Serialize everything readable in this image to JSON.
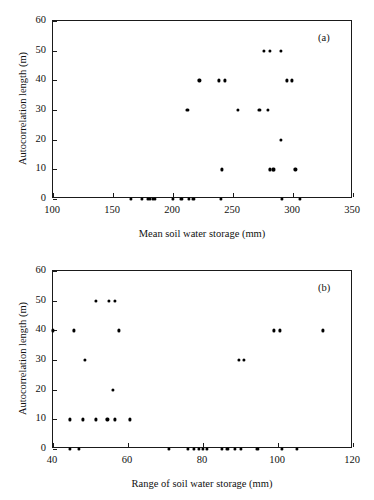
{
  "figure": {
    "background": "#ffffff",
    "marker_color": "#000000",
    "axis_color": "#1a1a1a"
  },
  "panels": [
    {
      "key": "a",
      "letter": "(a)",
      "xlabel": "Mean soil water storage (mm)",
      "ylabel": "Autocorrelation length (m)",
      "xticks": [
        "100",
        "150",
        "200",
        "250",
        "300",
        "350"
      ],
      "yticks": [
        "0",
        "10",
        "20",
        "30",
        "40",
        "50",
        "60"
      ]
    },
    {
      "key": "b",
      "letter": "(b)",
      "xlabel": "Range of soil water storage (mm)",
      "ylabel": "Autocorrelation length (m)",
      "xticks": [
        "40",
        "60",
        "80",
        "100",
        "120"
      ],
      "yticks": [
        "0",
        "10",
        "20",
        "30",
        "40",
        "50",
        "60"
      ]
    }
  ],
  "chart_data": [
    {
      "type": "scatter",
      "panel": "(a)",
      "title": "",
      "xlabel": "Mean soil water storage (mm)",
      "ylabel": "Autocorrelation length (m)",
      "xlim": [
        100,
        350
      ],
      "ylim": [
        0,
        60
      ],
      "xticks": [
        100,
        150,
        200,
        250,
        300,
        350
      ],
      "yticks": [
        0,
        10,
        20,
        30,
        40,
        50,
        60
      ],
      "grid": false,
      "legend": null,
      "marker": "filled-circle",
      "series": [
        {
          "name": "Autocorrelation length vs mean soil water storage",
          "points": [
            [
              165,
              0
            ],
            [
              174,
              0
            ],
            [
              179,
              0
            ],
            [
              181,
              0
            ],
            [
              183,
              0
            ],
            [
              185,
              0
            ],
            [
              200,
              0
            ],
            [
              207,
              0
            ],
            [
              213,
              0
            ],
            [
              217,
              0
            ],
            [
              240,
              0
            ],
            [
              291,
              0
            ],
            [
              306,
              0
            ],
            [
              241,
              10
            ],
            [
              281,
              10
            ],
            [
              283,
              10
            ],
            [
              284,
              10
            ],
            [
              302,
              10
            ],
            [
              290,
              20
            ],
            [
              212,
              30
            ],
            [
              254,
              30
            ],
            [
              272,
              30
            ],
            [
              279,
              30
            ],
            [
              222,
              40
            ],
            [
              238,
              40
            ],
            [
              243,
              40
            ],
            [
              295,
              40
            ],
            [
              299,
              40
            ],
            [
              276,
              50
            ],
            [
              281,
              50
            ],
            [
              290,
              50
            ]
          ]
        }
      ]
    },
    {
      "type": "scatter",
      "panel": "(b)",
      "title": "",
      "xlabel": "Range of soil water storage (mm)",
      "ylabel": "Autocorrelation length (m)",
      "xlim": [
        40,
        120
      ],
      "ylim": [
        0,
        60
      ],
      "xticks": [
        40,
        60,
        80,
        100,
        120
      ],
      "yticks": [
        0,
        10,
        20,
        30,
        40,
        50,
        60
      ],
      "grid": false,
      "legend": null,
      "marker": "filled-circle",
      "series": [
        {
          "name": "Autocorrelation length vs range of soil water storage",
          "points": [
            [
              44.5,
              0
            ],
            [
              47,
              0
            ],
            [
              71,
              0
            ],
            [
              76,
              0
            ],
            [
              77.5,
              0
            ],
            [
              79,
              0
            ],
            [
              80,
              0
            ],
            [
              81,
              0
            ],
            [
              85,
              0
            ],
            [
              86.5,
              0
            ],
            [
              88.5,
              0
            ],
            [
              90,
              0
            ],
            [
              94.5,
              0
            ],
            [
              101,
              0
            ],
            [
              105,
              0
            ],
            [
              44.5,
              10
            ],
            [
              48,
              10
            ],
            [
              51.5,
              10
            ],
            [
              54.5,
              10
            ],
            [
              56.5,
              10
            ],
            [
              60.5,
              10
            ],
            [
              56,
              20
            ],
            [
              48.5,
              30
            ],
            [
              89.5,
              30
            ],
            [
              91,
              30
            ],
            [
              40,
              40
            ],
            [
              45.5,
              40
            ],
            [
              57.5,
              40
            ],
            [
              99,
              40
            ],
            [
              100.5,
              40
            ],
            [
              112,
              40
            ],
            [
              51.5,
              50
            ],
            [
              55,
              50
            ],
            [
              56.5,
              50
            ]
          ]
        }
      ]
    }
  ]
}
